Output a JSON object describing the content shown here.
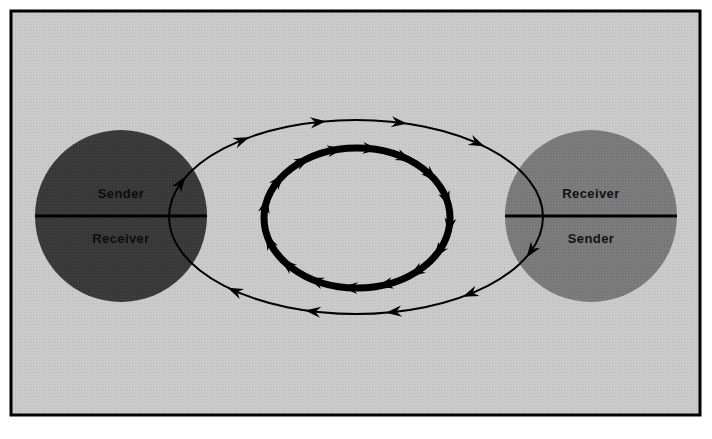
{
  "figure": {
    "background_color": "#ffffff",
    "frame": {
      "border_color": "#000000",
      "fill_color": "#c9c9c9",
      "x": 11,
      "y": 11,
      "width": 689,
      "height": 404,
      "border_width": 3
    }
  },
  "nodes": [
    {
      "id": "left-party",
      "name": "left-party-circle",
      "cx": 121,
      "cy": 216,
      "r": 86,
      "fill_color": "#3a3a3a",
      "divider_color": "#000000",
      "top_label": "Sender",
      "bottom_label": "Receiver",
      "label_color": "#0d0d0d"
    },
    {
      "id": "right-party",
      "name": "right-party-circle",
      "cx": 591,
      "cy": 216,
      "r": 86,
      "fill_color": "#7a7a7a",
      "divider_color": "#000000",
      "top_label": "Receiver",
      "bottom_label": "Sender",
      "label_color": "#111111"
    }
  ],
  "flows": {
    "outer_loop": {
      "name": "outer-message-loop",
      "cx": 356,
      "cy": 217,
      "rx": 187,
      "ry": 97,
      "stroke_color": "#000000",
      "stroke_width": 2,
      "direction": "clockwise",
      "arrow_count": 8,
      "arrow_angles_deg": [
        200,
        232,
        258,
        283,
        310,
        20,
        52,
        78,
        103,
        130
      ]
    },
    "inner_loop": {
      "name": "inner-feedback-loop",
      "cx": 357,
      "cy": 218,
      "rx": 93,
      "ry": 70,
      "stroke_color": "#000000",
      "stroke_width": 7,
      "direction": "clockwise",
      "arrow_count": 16,
      "arrow_angles_deg": [
        190,
        212,
        234,
        256,
        278,
        300,
        322,
        344,
        6,
        28,
        50,
        72,
        94,
        116,
        138,
        160
      ]
    }
  }
}
